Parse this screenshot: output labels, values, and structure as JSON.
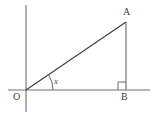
{
  "figure": {
    "kind": "right-triangle-angle-diagram",
    "background_color": "#ffffff",
    "stroke_color": "#5a5a5a",
    "line_color": "#3d3d3d",
    "text_color": "#3a3a3a",
    "labels": {
      "origin": "O",
      "apex": "A",
      "foot": "B",
      "angle": "x"
    },
    "axes": {
      "x_axis": {
        "x1": 8,
        "y1": 90,
        "x2": 150,
        "y2": 90
      },
      "y_axis": {
        "x1": 26,
        "y1": 5,
        "x2": 26,
        "y2": 112
      }
    },
    "triangle": {
      "origin_point": {
        "x": 26,
        "y": 90
      },
      "apex_point": {
        "x": 126,
        "y": 22
      },
      "foot_point": {
        "x": 126,
        "y": 90
      },
      "hypotenuse": {
        "x1": 26,
        "y1": 90,
        "x2": 126,
        "y2": 22
      },
      "vertical_leg": {
        "x1": 126,
        "y1": 22,
        "x2": 126,
        "y2": 90
      },
      "horizontal_leg": {
        "x1": 26,
        "y1": 90,
        "x2": 126,
        "y2": 90
      }
    },
    "angle_arc": {
      "center": {
        "x": 26,
        "y": 90
      },
      "radius": 27,
      "start_deg": 0,
      "end_deg": 34
    },
    "right_angle_marker": {
      "x": 118,
      "y": 82,
      "size": 8
    }
  }
}
